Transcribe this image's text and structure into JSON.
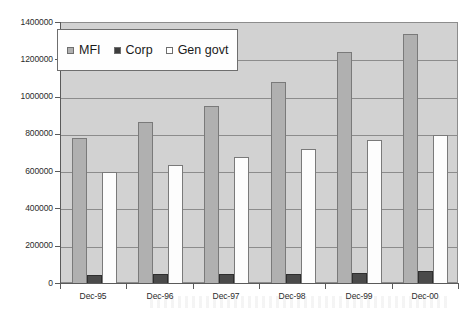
{
  "chart_data": {
    "type": "bar",
    "title": "",
    "subtitle": "",
    "xlabel": "",
    "ylabel": "",
    "categories": [
      "Dec-95",
      "Dec-96",
      "Dec-97",
      "Dec-98",
      "Dec-99",
      "Dec-00"
    ],
    "series": [
      {
        "name": "MFI",
        "color": "#b0b0b0",
        "values": [
          785000,
          870000,
          955000,
          1085000,
          1245000,
          1340000
        ]
      },
      {
        "name": "Corp",
        "color": "#4a4a4a",
        "values": [
          50000,
          52000,
          52000,
          55000,
          58000,
          70000
        ]
      },
      {
        "name": "Gen govt",
        "color": "#ffffff",
        "values": [
          600000,
          640000,
          680000,
          725000,
          770000,
          800000
        ]
      }
    ],
    "ylim": [
      0,
      1400000
    ],
    "yticks": [
      0,
      200000,
      400000,
      600000,
      800000,
      1000000,
      1200000,
      1400000
    ],
    "ytick_labels": [
      "0",
      "200000",
      "400000",
      "600000",
      "800000",
      "1000000",
      "1200000",
      "1400000"
    ],
    "grid": true,
    "grid_axis": "y",
    "legend_position": "upper left",
    "plot_background": "#d2d2d2",
    "figure_background": "#ffffff"
  },
  "legend": {
    "entries": [
      {
        "label": "MFI",
        "swatch": "series-mfi"
      },
      {
        "label": "Corp",
        "swatch": "series-corp"
      },
      {
        "label": "Gen govt",
        "swatch": "series-gengovt"
      }
    ]
  }
}
